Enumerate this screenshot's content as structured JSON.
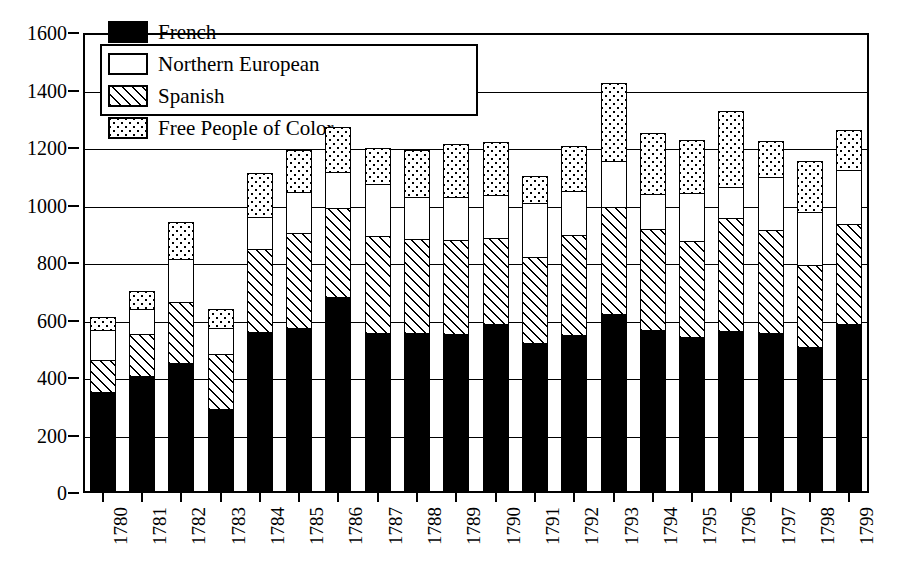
{
  "chart_data": {
    "type": "bar",
    "subtype": "stacked-bar",
    "title": "",
    "xlabel": "",
    "ylabel": "",
    "ylim": [
      0,
      1600
    ],
    "ytick_step": 200,
    "yticks": [
      0,
      200,
      400,
      600,
      800,
      1000,
      1200,
      1400,
      1600
    ],
    "grid": true,
    "legend_position": "top-left-inside",
    "categories": [
      "1780",
      "1781",
      "1782",
      "1783",
      "1784",
      "1785",
      "1786",
      "1787",
      "1788",
      "1789",
      "1790",
      "1791",
      "1792",
      "1793",
      "1794",
      "1795",
      "1796",
      "1797",
      "1798",
      "1799"
    ],
    "series": [
      {
        "name": "French",
        "pattern": "solid-black",
        "values": [
          348,
          402,
          450,
          288,
          558,
          572,
          678,
          552,
          552,
          548,
          583,
          518,
          545,
          620,
          565,
          538,
          560,
          552,
          505,
          583
        ]
      },
      {
        "name": "Spanish",
        "pattern": "diagonal-hatch",
        "values": [
          110,
          148,
          210,
          192,
          288,
          330,
          310,
          338,
          328,
          330,
          300,
          298,
          350,
          370,
          350,
          335,
          392,
          358,
          285,
          348
        ]
      },
      {
        "name": "Northern European",
        "pattern": "white-empty",
        "values": [
          105,
          88,
          150,
          90,
          112,
          142,
          125,
          182,
          145,
          148,
          150,
          190,
          152,
          162,
          120,
          168,
          108,
          185,
          185,
          188
        ]
      },
      {
        "name": "Free People of Color",
        "pattern": "dotted",
        "values": [
          45,
          62,
          130,
          65,
          152,
          145,
          155,
          123,
          165,
          185,
          185,
          92,
          158,
          272,
          215,
          185,
          265,
          125,
          175,
          140
        ]
      }
    ],
    "totals": [
      608,
      700,
      940,
      635,
      1110,
      1189,
      1268,
      1195,
      1190,
      1211,
      1218,
      1098,
      1205,
      1424,
      1250,
      1226,
      1325,
      1220,
      1150,
      1259
    ],
    "legend": [
      {
        "label": "French",
        "pattern": "solid-black"
      },
      {
        "label": "Northern European",
        "pattern": "white-empty"
      },
      {
        "label": "Spanish",
        "pattern": "diagonal-hatch"
      },
      {
        "label": "Free People of Color",
        "pattern": "dotted"
      }
    ],
    "colors": {
      "ink": "#000000",
      "background": "#ffffff"
    }
  }
}
